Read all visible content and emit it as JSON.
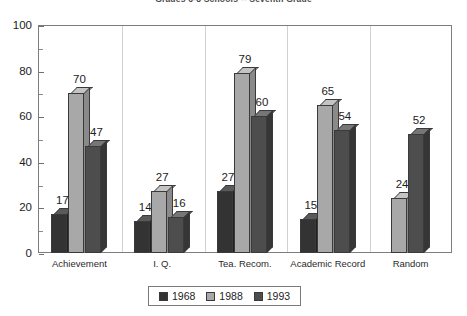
{
  "chart_data": {
    "type": "bar",
    "title": "Grades 6-8 Schools -- Seventh Grade",
    "xlabel": "",
    "ylabel": "",
    "ylim": [
      0,
      100
    ],
    "ytick_step": 20,
    "yminor_step": 10,
    "grid": false,
    "legend_position": "bottom-center",
    "style": "3d-grouped-columns",
    "categories": [
      "Achievement",
      "I. Q.",
      "Tea. Recom.",
      "Academic Record",
      "Random"
    ],
    "ytick_labels": [
      "0",
      "20",
      "40",
      "60",
      "80",
      "100"
    ],
    "series": [
      {
        "name": "1968",
        "color": "#333333",
        "top_color": "#5a5a5a",
        "side_color": "#1f1f1f",
        "values": [
          17,
          14,
          27,
          15,
          null
        ],
        "labels": [
          "17",
          "14",
          "27",
          "15",
          ""
        ]
      },
      {
        "name": "1988",
        "color": "#a8a8a8",
        "top_color": "#c4c4c4",
        "side_color": "#8a8a8a",
        "values": [
          70,
          27,
          79,
          65,
          24
        ],
        "labels": [
          "70",
          "27",
          "79",
          "65",
          "24"
        ]
      },
      {
        "name": "1993",
        "color": "#4d4d4d",
        "top_color": "#767676",
        "side_color": "#363636",
        "values": [
          47,
          16,
          60,
          54,
          52
        ],
        "labels": [
          "47",
          "16",
          "60",
          "54",
          "52"
        ]
      }
    ]
  },
  "legend": {
    "items": [
      {
        "label": "1968"
      },
      {
        "label": "1988"
      },
      {
        "label": "1993"
      }
    ]
  },
  "colors": {
    "frame": "#7d7d7d",
    "background": "#ffffff",
    "text": "#1d1d1d",
    "separator": "#d2d2d2"
  }
}
